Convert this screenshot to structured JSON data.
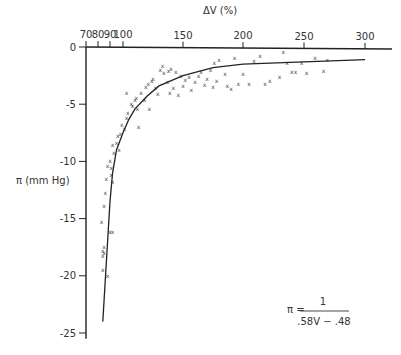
{
  "chart_data": {
    "type": "scatter",
    "title": "",
    "xlabel": "ΔV (%)",
    "ylabel": "π (mm Hg)",
    "xlabel_position": "top",
    "x_ticks": [
      70,
      80,
      90,
      100,
      150,
      200,
      250,
      300
    ],
    "y_ticks": [
      0,
      -5,
      -10,
      -15,
      -20,
      -25
    ],
    "xlim": [
      70,
      310
    ],
    "ylim": [
      -25,
      0
    ],
    "grid": false,
    "legend": null,
    "marker": "x",
    "annotation": {
      "lhs": "π =",
      "numerator": "1",
      "denominator": ".58V − .48"
    },
    "series": [
      {
        "name": "observations",
        "kind": "scatter",
        "points": [
          [
            88,
            -20.0
          ],
          [
            84,
            -17.8
          ],
          [
            84,
            -18.3
          ],
          [
            84,
            -19.5
          ],
          [
            85,
            -18.0
          ],
          [
            85,
            -17.5
          ],
          [
            83,
            -15.3
          ],
          [
            85,
            -13.9
          ],
          [
            86,
            -12.8
          ],
          [
            87,
            -11.5
          ],
          [
            88,
            -10.4
          ],
          [
            90,
            -10.0
          ],
          [
            91,
            -10.6
          ],
          [
            91,
            -11.2
          ],
          [
            92,
            -11.8
          ],
          [
            90,
            -16.2
          ],
          [
            92,
            -16.2
          ],
          [
            93,
            -9.3
          ],
          [
            92,
            -8.6
          ],
          [
            95,
            -8.4
          ],
          [
            96,
            -7.8
          ],
          [
            98,
            -7.6
          ],
          [
            97,
            -9.0
          ],
          [
            99,
            -6.8
          ],
          [
            101,
            -7.2
          ],
          [
            103,
            -6.2
          ],
          [
            104,
            -5.8
          ],
          [
            107,
            -5.0
          ],
          [
            108,
            -5.2
          ],
          [
            103,
            -4.0
          ],
          [
            110,
            -4.6
          ],
          [
            111,
            -4.5
          ],
          [
            112,
            -5.4
          ],
          [
            113,
            -7.0
          ],
          [
            115,
            -4.0
          ],
          [
            118,
            -4.6
          ],
          [
            119,
            -3.5
          ],
          [
            121,
            -3.2
          ],
          [
            124,
            -3.0
          ],
          [
            125,
            -2.8
          ],
          [
            127,
            -3.6
          ],
          [
            129,
            -4.1
          ],
          [
            122,
            -5.4
          ],
          [
            133,
            -1.7
          ],
          [
            134,
            -2.3
          ],
          [
            137,
            -3.1
          ],
          [
            139,
            -4.0
          ],
          [
            142,
            -3.6
          ],
          [
            144,
            -2.2
          ],
          [
            146,
            -4.2
          ],
          [
            131,
            -2.0
          ],
          [
            138,
            -2.1
          ],
          [
            140,
            -1.9
          ],
          [
            148,
            -2.5
          ],
          [
            150,
            -3.4
          ],
          [
            152,
            -2.9
          ],
          [
            155,
            -2.6
          ],
          [
            157,
            -3.8
          ],
          [
            160,
            -3.1
          ],
          [
            163,
            -2.5
          ],
          [
            165,
            -2.2
          ],
          [
            168,
            -3.3
          ],
          [
            170,
            -2.8
          ],
          [
            173,
            -2.0
          ],
          [
            175,
            -3.5
          ],
          [
            178,
            -3.0
          ],
          [
            176,
            -1.4
          ],
          [
            180,
            -1.1
          ],
          [
            185,
            -2.4
          ],
          [
            187,
            -3.4
          ],
          [
            190,
            -3.7
          ],
          [
            193,
            -1.0
          ],
          [
            196,
            -3.2
          ],
          [
            200,
            -2.4
          ],
          [
            205,
            -3.2
          ],
          [
            209,
            -1.2
          ],
          [
            214,
            -0.8
          ],
          [
            218,
            -3.2
          ],
          [
            222,
            -3.0
          ],
          [
            230,
            -2.6
          ],
          [
            233,
            -0.4
          ],
          [
            236,
            -1.4
          ],
          [
            240,
            -2.2
          ],
          [
            243,
            -2.2
          ],
          [
            248,
            -1.4
          ],
          [
            252,
            -2.3
          ],
          [
            259,
            -1.0
          ],
          [
            266,
            -2.1
          ],
          [
            269,
            -1.1
          ]
        ]
      },
      {
        "name": "fit",
        "kind": "line",
        "equation": "π = 1 / (.58V − .48)",
        "points": [
          [
            84,
            -24.0
          ],
          [
            86,
            -20.5
          ],
          [
            88,
            -17.0
          ],
          [
            90,
            -13.5
          ],
          [
            92,
            -11.0
          ],
          [
            95,
            -9.0
          ],
          [
            100,
            -7.5
          ],
          [
            105,
            -6.3
          ],
          [
            110,
            -5.4
          ],
          [
            120,
            -4.3
          ],
          [
            130,
            -3.4
          ],
          [
            150,
            -2.5
          ],
          [
            175,
            -1.8
          ],
          [
            200,
            -1.5
          ],
          [
            250,
            -1.3
          ],
          [
            300,
            -1.1
          ]
        ]
      }
    ]
  }
}
